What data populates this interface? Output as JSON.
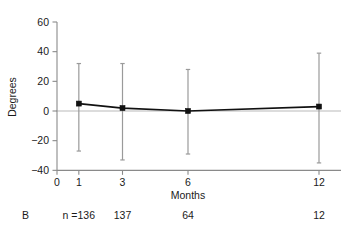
{
  "figure": {
    "panel_label": "B",
    "n_prefix": "n ="
  },
  "chart_data": {
    "type": "line",
    "title": "",
    "xlabel": "Months",
    "ylabel": "Degrees",
    "x": [
      1,
      3,
      6,
      12
    ],
    "values": [
      5,
      2,
      0,
      3
    ],
    "error_low": [
      -27,
      -33,
      -29,
      -35
    ],
    "error_high": [
      32,
      32,
      28,
      39
    ],
    "xtick_values": [
      0,
      1,
      3,
      6,
      12
    ],
    "xtick_labels": [
      "0",
      "1",
      "3",
      "6",
      "12"
    ],
    "ytick_values": [
      60,
      40,
      20,
      0,
      -20,
      -40
    ],
    "ytick_labels": [
      "60",
      "40",
      "20",
      "0",
      "−20",
      "−40"
    ],
    "xlim": [
      0,
      13.2
    ],
    "ylim": [
      -40,
      60
    ],
    "grid": false,
    "legend": "none",
    "sample_sizes": [
      "136",
      "137",
      "64",
      "12"
    ],
    "marker_style": "square",
    "error_style": "vertical-bar-with-caps",
    "zero_reference_line": true
  },
  "colors": {
    "line": "#111111",
    "marker": "#111111",
    "error": "#9a9a9a",
    "axis": "#8a8a8a",
    "zero_line": "#b9b9b9",
    "text": "#1a1a1a",
    "background": "#ffffff"
  }
}
